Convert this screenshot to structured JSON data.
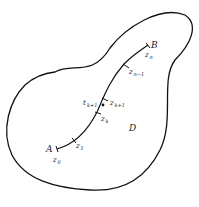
{
  "diagram": {
    "region_label": "D",
    "endpoints": {
      "start": "A",
      "end": "B"
    },
    "points": [
      {
        "name": "z0",
        "base": "z",
        "sub": "0"
      },
      {
        "name": "z1",
        "base": "z",
        "sub": "1"
      },
      {
        "name": "zk",
        "base": "z",
        "sub": "k"
      },
      {
        "name": "tk+1",
        "base": "t",
        "sub": "k+1"
      },
      {
        "name": "zk+1",
        "base": "z",
        "sub": "k+1"
      },
      {
        "name": "zn-1",
        "base": "z",
        "sub": "n−1"
      },
      {
        "name": "zn",
        "base": "z",
        "sub": "n"
      }
    ],
    "colors": {
      "stroke": "#111111",
      "background": "#ffffff"
    }
  }
}
